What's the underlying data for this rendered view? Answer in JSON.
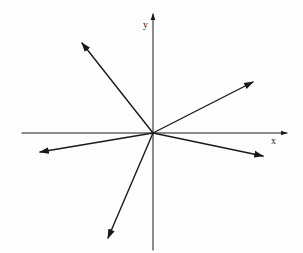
{
  "diagram": {
    "type": "vector-diagram",
    "colors": {
      "ink": "#1a1a1a",
      "paper": "#fdfdfd"
    },
    "origin": {
      "x": 153,
      "y": 133
    },
    "axes": {
      "x": {
        "label": "x",
        "from": [
          22,
          133
        ],
        "to": [
          287,
          133
        ],
        "label_pos": [
          271,
          144
        ]
      },
      "y": {
        "label": "y",
        "from": [
          153,
          250
        ],
        "to": [
          153,
          14
        ],
        "label_pos": [
          143,
          28
        ]
      }
    },
    "vectors": [
      {
        "id": "v1",
        "direction": "up-left",
        "to": [
          82,
          43
        ]
      },
      {
        "id": "v2",
        "direction": "up-right",
        "to": [
          253,
          82
        ]
      },
      {
        "id": "v3",
        "direction": "left-slightly-down",
        "to": [
          40,
          152
        ]
      },
      {
        "id": "v4",
        "direction": "right-slightly-down",
        "to": [
          263,
          156
        ]
      },
      {
        "id": "v5",
        "direction": "down-left-steep",
        "to": [
          108,
          238
        ]
      }
    ]
  }
}
